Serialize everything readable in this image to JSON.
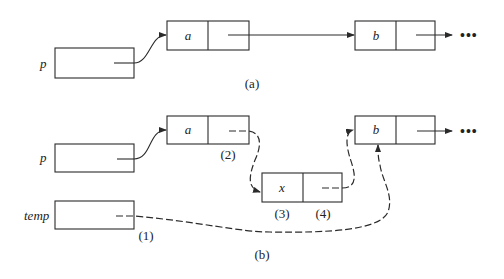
{
  "diagram": {
    "type": "linked-list-insertion",
    "colors": {
      "stroke": "#2a2a2a",
      "background": "#ffffff"
    },
    "part_a": {
      "caption": "(a)",
      "pointer_label": "p",
      "nodes": [
        {
          "value": "a"
        },
        {
          "value": "b"
        }
      ],
      "continuation": "•••"
    },
    "part_b": {
      "caption": "(b)",
      "pointer_label": "p",
      "temp_label": "temp",
      "nodes": [
        {
          "value": "a"
        },
        {
          "value": "x"
        },
        {
          "value": "b"
        }
      ],
      "continuation": "•••",
      "step_labels": {
        "step1": "(1)",
        "step2": "(2)",
        "step3": "(3)",
        "step4": "(4)"
      }
    }
  }
}
